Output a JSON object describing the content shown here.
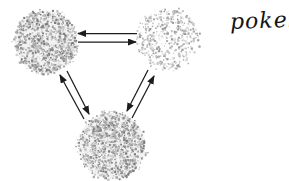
{
  "annotation": {
    "text": "pokek",
    "ink_color": "#141414"
  },
  "diagram": {
    "type": "state-equilibrium-triangle",
    "arrow_color": "#1c1c1c",
    "background_color": "#ffffff",
    "nodes": [
      {
        "name": "molecule-top-left",
        "cx": 46,
        "cy": 42,
        "r": 33,
        "density": 1.0,
        "base": "#f2f2f2",
        "palette": [
          "#7d7d7d",
          "#949494",
          "#a8a8a8",
          "#bcbcbc",
          "#d0d0d0"
        ]
      },
      {
        "name": "molecule-top-right",
        "cx": 168,
        "cy": 39,
        "r": 32,
        "density": 0.55,
        "base": "",
        "palette": [
          "#9b9b9b",
          "#b2b2b2",
          "#c6c6c6",
          "#dadada"
        ]
      },
      {
        "name": "molecule-bottom",
        "cx": 112,
        "cy": 146,
        "r": 35,
        "density": 1.0,
        "base": "#f2f2f2",
        "palette": [
          "#7d7d7d",
          "#949494",
          "#a8a8a8",
          "#bcbcbc",
          "#d0d0d0"
        ]
      }
    ],
    "edges": [
      {
        "name": "arrow-topright-to-topleft",
        "x1": 137,
        "y1": 33.5,
        "x2": 78,
        "y2": 33.5
      },
      {
        "name": "arrow-topleft-to-topright",
        "x1": 78,
        "y1": 42,
        "x2": 136,
        "y2": 42
      },
      {
        "name": "arrow-bottom-to-topleft",
        "x1": 84,
        "y1": 119,
        "x2": 60,
        "y2": 75
      },
      {
        "name": "arrow-topleft-to-bottom",
        "x1": 67,
        "y1": 71,
        "x2": 89,
        "y2": 114
      },
      {
        "name": "arrow-topright-to-bottom",
        "x1": 148,
        "y1": 70,
        "x2": 127,
        "y2": 111
      },
      {
        "name": "arrow-bottom-to-topright",
        "x1": 132,
        "y1": 118,
        "x2": 154,
        "y2": 76
      }
    ]
  }
}
